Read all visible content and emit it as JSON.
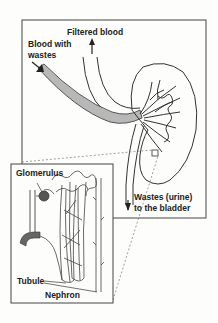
{
  "diagram": {
    "labels": {
      "filtered_blood": "Filtered blood",
      "blood_with_wastes_1": "Blood with",
      "blood_with_wastes_2": "wastes",
      "wastes_urine_1": "Wastes (urine)",
      "wastes_urine_2": "to the bladder",
      "glomerulus": "Glomerulus",
      "tubule": "Tubule",
      "nephron": "Nephron"
    },
    "colors": {
      "line": "#333333",
      "vessel_fill": "#b8b8b8",
      "dark_fill": "#555555",
      "background": "#fdfdfb"
    }
  }
}
